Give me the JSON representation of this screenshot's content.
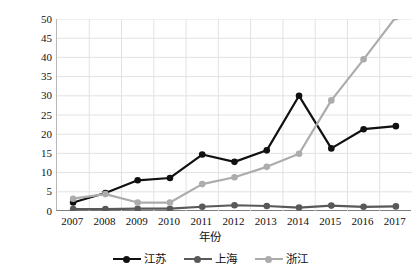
{
  "chart_data": {
    "type": "line",
    "title": "",
    "xlabel": "年份",
    "ylabel": "增殖放流数量/亿单位",
    "categories": [
      "2007",
      "2008",
      "2009",
      "2010",
      "2011",
      "2012",
      "2013",
      "2014",
      "2015",
      "2016",
      "2017"
    ],
    "x": [
      2007,
      2008,
      2009,
      2010,
      2011,
      2012,
      2013,
      2014,
      2015,
      2016,
      2017
    ],
    "ylim": [
      0,
      50
    ],
    "yticks": [
      0,
      5,
      10,
      15,
      20,
      25,
      30,
      35,
      40,
      45,
      50
    ],
    "grid": true,
    "legend_position": "bottom",
    "series": [
      {
        "name": "江苏",
        "color": "#111111",
        "marker": "circle",
        "values": [
          2.2,
          4.7,
          8.0,
          8.6,
          14.7,
          12.8,
          15.8,
          30.0,
          16.3,
          21.3,
          22.1
        ]
      },
      {
        "name": "上海",
        "color": "#595959",
        "marker": "circle",
        "values": [
          0.5,
          0.5,
          0.6,
          0.6,
          1.1,
          1.5,
          1.3,
          0.9,
          1.4,
          1.1,
          1.2
        ]
      },
      {
        "name": "浙江",
        "color": "#acacac",
        "marker": "circle",
        "values": [
          3.2,
          4.4,
          2.2,
          2.2,
          7.0,
          8.8,
          11.5,
          14.9,
          28.8,
          39.5,
          50.5
        ]
      }
    ]
  },
  "axes": {
    "y_title": "增殖放流数量/亿单位",
    "x_title": "年份",
    "y_tick_labels": [
      "50",
      "45",
      "40",
      "35",
      "30",
      "25",
      "20",
      "15",
      "10",
      "5",
      "0"
    ],
    "x_tick_labels": [
      "2007",
      "2008",
      "2009",
      "2010",
      "2011",
      "2012",
      "2013",
      "2014",
      "2015",
      "2016",
      "2017"
    ]
  },
  "legend": {
    "items": [
      {
        "label": "江苏",
        "color": "#111111"
      },
      {
        "label": "上海",
        "color": "#595959"
      },
      {
        "label": "浙江",
        "color": "#acacac"
      }
    ]
  },
  "style": {
    "grid_color": "#e2e2e2",
    "axis_color": "#7d7d7d",
    "background": "#ffffff"
  }
}
